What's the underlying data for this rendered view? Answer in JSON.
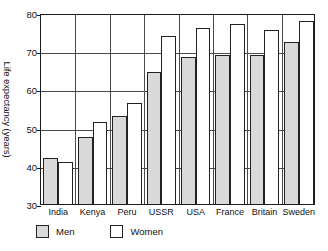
{
  "chart_data": {
    "type": "bar",
    "title": "",
    "xlabel": "",
    "ylabel": "Life expectancy (years)",
    "categories": [
      "India",
      "Kenya",
      "Peru",
      "USSR",
      "USA",
      "France",
      "Britain",
      "Sweden"
    ],
    "series": [
      {
        "name": "Men",
        "color": "#d9d9d9",
        "values": [
          42,
          47.5,
          53,
          64.5,
          68.5,
          69,
          69,
          72.5
        ]
      },
      {
        "name": "Women",
        "color": "#ffffff",
        "values": [
          41,
          51.5,
          56.5,
          74,
          76,
          77,
          75.5,
          78
        ]
      }
    ],
    "ylim": [
      30,
      80
    ],
    "yticks": [
      30,
      40,
      50,
      60,
      70,
      80
    ],
    "ytick_labels": [
      "30",
      "40",
      "50",
      "60",
      "70",
      "80"
    ],
    "grid": "horizontal-and-vertical",
    "legend_position": "below-plot",
    "legend": [
      "Men",
      "Women"
    ]
  }
}
